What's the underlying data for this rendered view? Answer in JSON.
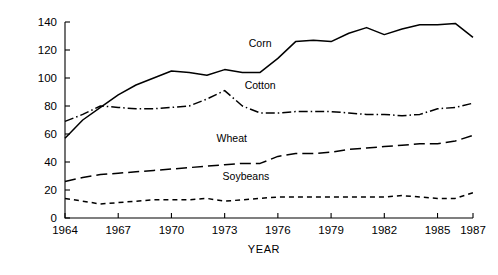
{
  "chart_data": {
    "type": "line",
    "title": "",
    "xlabel": "YEAR",
    "ylabel": "NITROGEN/ACRE (lb)",
    "xlim": [
      1964,
      1987
    ],
    "ylim": [
      0,
      140
    ],
    "grid": false,
    "legend_position": "inline-labels",
    "x": [
      1964,
      1965,
      1966,
      1967,
      1968,
      1969,
      1970,
      1971,
      1972,
      1973,
      1974,
      1975,
      1976,
      1977,
      1978,
      1979,
      1980,
      1981,
      1982,
      1983,
      1984,
      1985,
      1986,
      1987
    ],
    "xticks": [
      1964,
      1967,
      1970,
      1973,
      1976,
      1979,
      1982,
      1985,
      1987
    ],
    "yticks": [
      0,
      20,
      40,
      60,
      80,
      100,
      120,
      140
    ],
    "series": [
      {
        "name": "Corn",
        "label": "Corn",
        "style": "solid",
        "color": "#000000",
        "values": [
          57,
          70,
          79,
          88,
          95,
          100,
          105,
          104,
          102,
          106,
          104,
          104,
          114,
          126,
          127,
          126,
          132,
          136,
          131,
          135,
          138,
          138,
          139,
          129
        ]
      },
      {
        "name": "Cotton",
        "label": "Cotton",
        "style": "dashdot",
        "color": "#000000",
        "values": [
          69,
          74,
          80,
          79,
          78,
          78,
          79,
          80,
          85,
          91,
          80,
          75,
          75,
          76,
          76,
          76,
          75,
          74,
          74,
          73,
          74,
          78,
          79,
          82
        ]
      },
      {
        "name": "Wheat",
        "label": "Wheat",
        "style": "longdash",
        "color": "#000000",
        "values": [
          26,
          29,
          31,
          32,
          33,
          34,
          35,
          36,
          37,
          38,
          39,
          39,
          44,
          46,
          46,
          47,
          49,
          50,
          51,
          52,
          53,
          53,
          55,
          59
        ]
      },
      {
        "name": "Soybeans",
        "label": "Soybeans",
        "style": "shortdash",
        "color": "#000000",
        "values": [
          14,
          12,
          10,
          11,
          12,
          13,
          13,
          13,
          14,
          12,
          13,
          14,
          15,
          15,
          15,
          15,
          15,
          15,
          15,
          16,
          15,
          14,
          14,
          18
        ]
      }
    ],
    "series_label_positions": [
      {
        "name": "Corn",
        "x": 1975.0,
        "y": 122
      },
      {
        "name": "Cotton",
        "x": 1975.0,
        "y": 92
      },
      {
        "name": "Wheat",
        "x": 1973.4,
        "y": 54
      },
      {
        "name": "Soybeans",
        "x": 1974.2,
        "y": 27
      }
    ]
  }
}
